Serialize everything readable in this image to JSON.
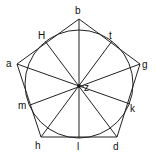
{
  "diagram": {
    "type": "pentagon with inscribed circle and diameters through center",
    "colors": {
      "stroke": "#222222",
      "text": "#111111",
      "background": "#ffffff"
    },
    "circle": {
      "center_label": "z",
      "cx": 79,
      "cy": 84,
      "r": 54
    },
    "pentagon_vertices": [
      {
        "label": "b",
        "x": 79,
        "y": 19,
        "lx": 75,
        "ly": 14
      },
      {
        "label": "g",
        "x": 140,
        "y": 64,
        "lx": 142,
        "ly": 68
      },
      {
        "label": "d",
        "x": 117,
        "y": 137,
        "lx": 113,
        "ly": 150
      },
      {
        "label": "h",
        "x": 41,
        "y": 137,
        "lx": 35,
        "ly": 149
      },
      {
        "label": "a",
        "x": 17,
        "y": 64,
        "lx": 6,
        "ly": 67
      }
    ],
    "tangent_points": [
      {
        "label": "H",
        "x": 45,
        "y": 41,
        "lx": 38,
        "ly": 39
      },
      {
        "label": "t",
        "x": 112,
        "y": 41,
        "lx": 109,
        "ly": 39
      },
      {
        "label": "k",
        "x": 130,
        "y": 104,
        "lx": 130,
        "ly": 112
      },
      {
        "label": "l",
        "x": 79,
        "y": 138,
        "lx": 77,
        "ly": 150
      },
      {
        "label": "m",
        "x": 30,
        "y": 105,
        "lx": 18,
        "ly": 109
      }
    ],
    "center": {
      "label": "z",
      "x": 79,
      "y": 86,
      "lx": 84,
      "ly": 91
    }
  }
}
